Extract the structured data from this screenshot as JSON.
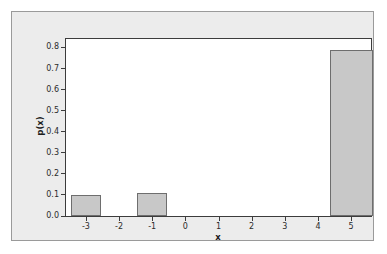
{
  "chart_data": {
    "type": "bar",
    "title": "",
    "subtitle": "",
    "xlabel": "x",
    "ylabel": "p(x)",
    "categories": [
      "-3",
      "-2",
      "-1",
      "0",
      "1",
      "2",
      "3",
      "4",
      "5"
    ],
    "values": [
      0.1,
      0,
      0.11,
      0,
      0,
      0,
      0,
      0,
      0.79
    ],
    "series": [
      {
        "name": "p(x)",
        "values": [
          0.1,
          0,
          0.11,
          0,
          0,
          0,
          0,
          0,
          0.79
        ]
      }
    ],
    "xlim": [
      -3.6,
      5.6
    ],
    "ylim": [
      0.0,
      0.84
    ],
    "ytick_labels": [
      "0.0",
      "0.1",
      "0.2",
      "0.3",
      "0.4",
      "0.5",
      "0.6",
      "0.7",
      "0.8"
    ],
    "ytick_values": [
      0.0,
      0.1,
      0.2,
      0.3,
      0.4,
      0.5,
      0.6,
      0.7,
      0.8
    ],
    "xtick_labels": [
      "-3",
      "-2",
      "-1",
      "0",
      "1",
      "2",
      "3",
      "4",
      "5"
    ],
    "xtick_values": [
      -3,
      -2,
      -1,
      0,
      1,
      2,
      3,
      4,
      5
    ],
    "grid": false,
    "legend": "none",
    "bars": [
      {
        "label": "-3",
        "x": -3,
        "value": 0.1,
        "width": 0.92
      },
      {
        "label": "-1",
        "x": -1,
        "value": 0.11,
        "width": 0.92
      },
      {
        "label": "5",
        "x": 5,
        "value": 0.79,
        "width": 1.3
      }
    ],
    "colors": {
      "bar_fill": "#c8c8c8",
      "bar_stroke": "#6e6e6e",
      "plot_background": "#ffffff",
      "figure_background": "#ececec",
      "axis_line": "#3c3c3c",
      "tick_text": "#2b2b2b",
      "panel_border": "#9a9a9a",
      "page_background": "#ffffff"
    }
  }
}
